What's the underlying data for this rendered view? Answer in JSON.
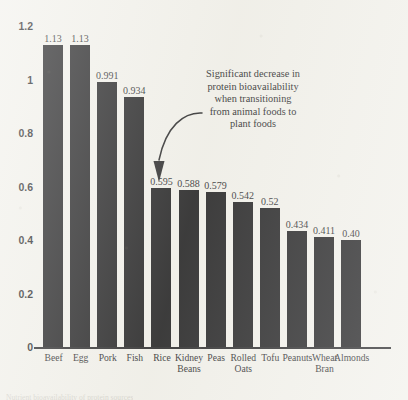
{
  "chart_data": {
    "type": "bar",
    "title": "",
    "xlabel": "",
    "ylabel": "",
    "ylim": [
      0,
      1.2
    ],
    "grid": false,
    "legend": null,
    "categories": [
      "Beef",
      "Egg",
      "Pork",
      "Fish",
      "Rice",
      "Kidney Beans",
      "Peas",
      "Rolled Oats",
      "Tofu",
      "Peanuts",
      "Wheat Bran",
      "Almonds"
    ],
    "values": [
      1.13,
      1.13,
      0.991,
      0.934,
      0.595,
      0.588,
      0.579,
      0.542,
      0.52,
      0.434,
      0.411,
      0.4
    ],
    "bar_labels": [
      "1.13",
      "1.13",
      "0.991",
      "0.934",
      "0.595",
      "0.588",
      "0.579",
      "0.542",
      "0.52",
      "0.434",
      "0.411",
      "0.40"
    ],
    "category_label_lines": [
      [
        "Beef"
      ],
      [
        "Egg"
      ],
      [
        "Pork"
      ],
      [
        "Fish"
      ],
      [
        "Rice"
      ],
      [
        "Kidney",
        "Beans"
      ],
      [
        "Peas"
      ],
      [
        "Rolled",
        "Oats"
      ],
      [
        "Tofu"
      ],
      [
        "Peanuts"
      ],
      [
        "Wheat",
        "Bran"
      ],
      [
        "Almonds"
      ]
    ],
    "y_ticks": [
      0,
      0.2,
      0.4,
      0.6,
      0.8,
      1,
      1.2
    ],
    "y_tick_labels": [
      "0",
      "0.2",
      "0.4",
      "0.6",
      "0.8",
      "1",
      "1.2"
    ],
    "annotations": [
      {
        "name": "bioavailability-note",
        "lines": [
          "Significant decrease in",
          "protein bioavailability",
          "when transitioning",
          "from animal foods to",
          "plant foods"
        ],
        "points_at": "Rice"
      }
    ],
    "colors": {
      "bar": "#111113",
      "background": "#f1f0ea",
      "axis": "#1b1b1d",
      "text": "#18181a"
    }
  },
  "bottom_caption": {
    "text": "Nutrient bioavailability of protein sources"
  }
}
